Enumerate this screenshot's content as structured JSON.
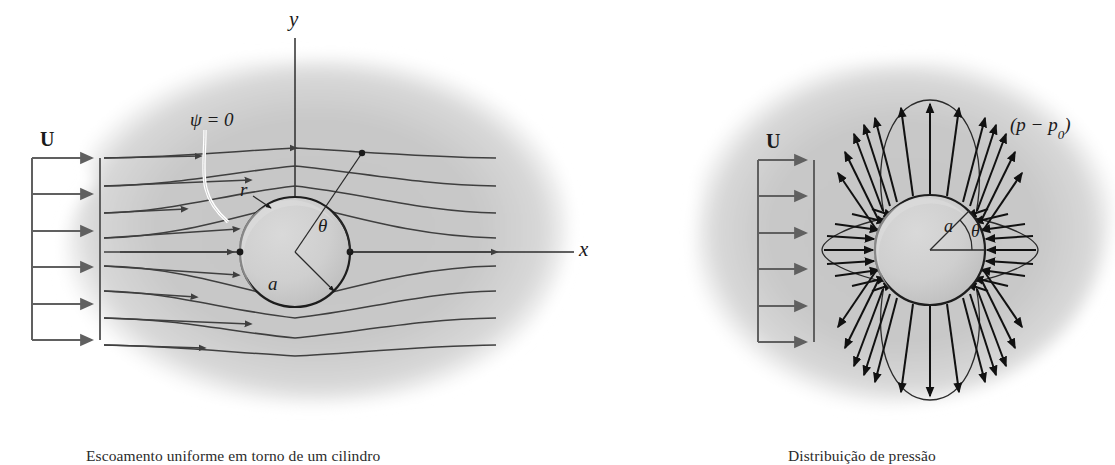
{
  "figure": {
    "background_color": "#c9c9c9",
    "line_color": "#3f3f3f",
    "arrow_color": "#111111",
    "cylinder_fill": "#c4c4c4",
    "cylinder_highlight": "#d6d6d6"
  },
  "panel_left": {
    "caption": "Escoamento uniforme em torno de um cilindro",
    "velocity_label": "U",
    "axis_y_label": "y",
    "axis_x_label": "x",
    "streamfunction_label": "ψ = 0",
    "radius_label": "r",
    "angle_label": "θ",
    "cylinder_radius_label": "a",
    "inlet_arrow_count": 6,
    "streamline_count": 9,
    "stagnation_points": 2,
    "cylinder": {
      "cx": 295,
      "cy": 252,
      "r": 55
    }
  },
  "panel_right": {
    "caption": "Distribuição de pressão",
    "velocity_label": "U",
    "pressure_label": "(p − p",
    "pressure_label_sub": "0",
    "pressure_label_close": ")",
    "cylinder_radius_label": "a",
    "angle_label": "θ",
    "inlet_arrow_count": 6,
    "cylinder": {
      "cx": 930,
      "cy": 250,
      "r": 55
    },
    "lobes": [
      {
        "name": "top-lobe",
        "direction": "outward",
        "sign": "negative"
      },
      {
        "name": "bottom-lobe",
        "direction": "outward",
        "sign": "negative"
      },
      {
        "name": "left-lobe",
        "direction": "inward",
        "sign": "positive"
      },
      {
        "name": "right-lobe",
        "direction": "inward",
        "sign": "positive"
      }
    ]
  }
}
